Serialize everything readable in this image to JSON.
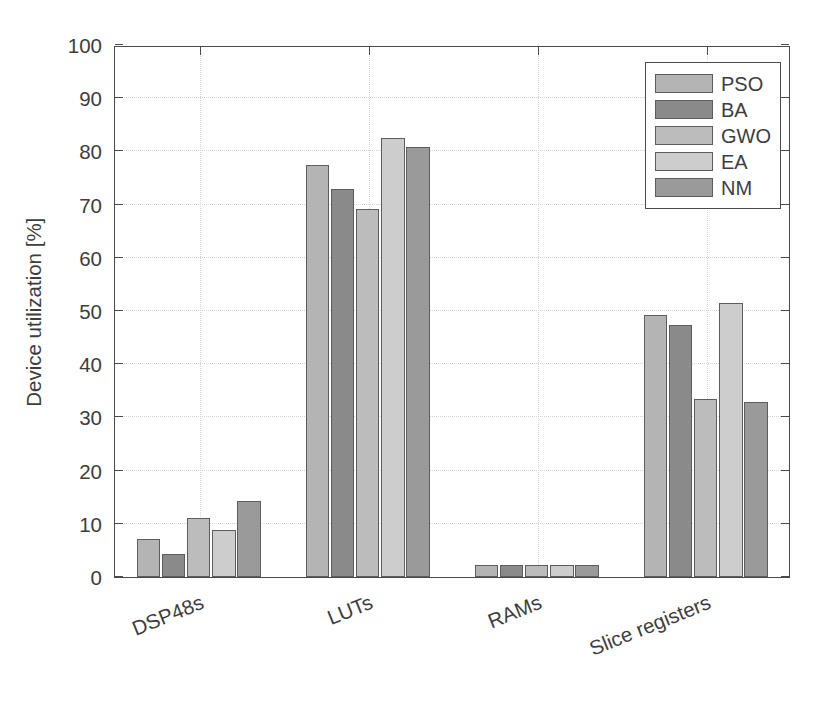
{
  "chart_data": {
    "type": "bar",
    "title": "",
    "xlabel": "",
    "ylabel": "Device utilization [%]",
    "ylim": [
      0,
      100
    ],
    "ytick_step": 10,
    "yticks": [
      0,
      10,
      20,
      30,
      40,
      50,
      60,
      70,
      80,
      90,
      100
    ],
    "ytick_labels": [
      "0",
      "10",
      "20",
      "30",
      "40",
      "50",
      "60",
      "70",
      "80",
      "90",
      "100"
    ],
    "grid": true,
    "legend_position": "top-right",
    "categories": [
      "DSP48s",
      "LUTs",
      "RAMs",
      "Slice registers"
    ],
    "series": [
      {
        "name": "PSO",
        "color": "#b4b4b4",
        "values": [
          7.2,
          77.5,
          2.2,
          49.2
        ]
      },
      {
        "name": "BA",
        "color": "#8a8a8a",
        "values": [
          4.3,
          73.0,
          2.2,
          47.3
        ]
      },
      {
        "name": "GWO",
        "color": "#bcbcbc",
        "values": [
          11.0,
          69.1,
          2.2,
          33.4
        ]
      },
      {
        "name": "EA",
        "color": "#cdcdcd",
        "values": [
          8.8,
          82.5,
          2.2,
          51.6
        ]
      },
      {
        "name": "NM",
        "color": "#9a9a9a",
        "values": [
          14.2,
          80.8,
          2.2,
          32.9
        ]
      }
    ]
  },
  "axes": {
    "edge_color": "#4a4a4a",
    "grid_color": "#d3d3d3",
    "text_color": "#3d3d3d",
    "bar_edge_color": "#5d5d5d"
  },
  "legend": {
    "entries": [
      "PSO",
      "BA",
      "GWO",
      "EA",
      "NM"
    ]
  }
}
